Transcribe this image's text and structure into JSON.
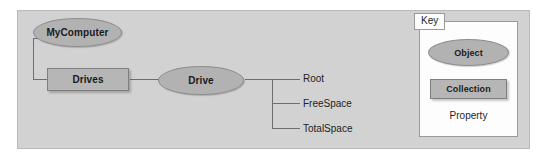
{
  "diagram": {
    "type": "object-model-tree",
    "nodes": [
      {
        "id": "mycomputer",
        "label": "MyComputer",
        "shape": "ellipse",
        "kind": "object"
      },
      {
        "id": "drives",
        "label": "Drives",
        "shape": "rectangle",
        "kind": "collection"
      },
      {
        "id": "drive",
        "label": "Drive",
        "shape": "ellipse",
        "kind": "object"
      }
    ],
    "properties": [
      {
        "id": "root",
        "label": "Root"
      },
      {
        "id": "freespace",
        "label": "FreeSpace"
      },
      {
        "id": "totalspace",
        "label": "TotalSpace"
      }
    ],
    "edges": [
      {
        "from": "mycomputer",
        "to": "drives"
      },
      {
        "from": "drives",
        "to": "drive"
      },
      {
        "from": "drive",
        "to": "root"
      },
      {
        "from": "drive",
        "to": "freespace"
      },
      {
        "from": "drive",
        "to": "totalspace"
      }
    ]
  },
  "key": {
    "title": "Key",
    "object_label": "Object",
    "collection_label": "Collection",
    "property_label": "Property"
  },
  "colors": {
    "panel_background": "#d2d2d2",
    "page_background": "#ffffff",
    "object_fill": "#b2b2b2",
    "object_stroke": "#8e8e8e",
    "collection_fill": "#b6b6b6",
    "collection_stroke": "#7f7f7f",
    "wire": "#6e6e6e",
    "key_background": "#fdfdfd",
    "text": "#1b1b1b"
  }
}
